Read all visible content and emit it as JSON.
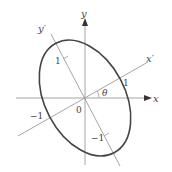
{
  "diagram": {
    "axes": {
      "x_label": "x",
      "y_label": "y",
      "x_prime_label": "x′",
      "y_prime_label": "y′",
      "angle_label": "θ",
      "origin_label": "0"
    },
    "ticks": {
      "x_neg": "−1",
      "x_prime_pos": "1",
      "y_prime_pos": "1",
      "y_prime_neg": "−1"
    },
    "colors": {
      "axis": "#999999",
      "ellipse": "#444444",
      "text": "#444444"
    }
  }
}
